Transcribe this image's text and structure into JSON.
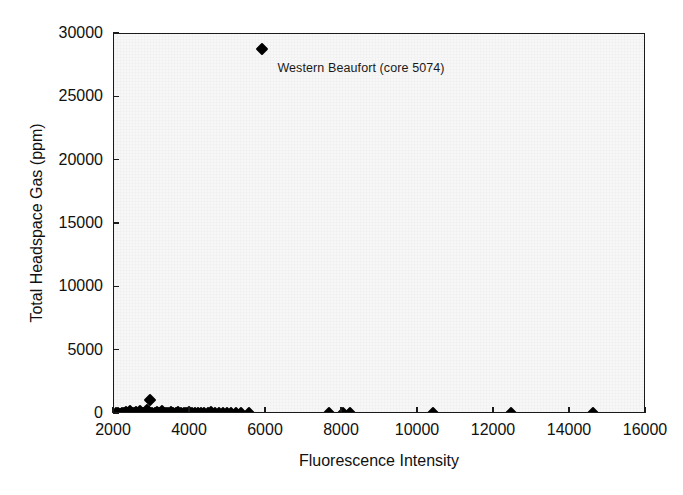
{
  "chart_data": {
    "type": "scatter",
    "title": "",
    "xlabel": "Fluorescence Intensity",
    "ylabel": "Total Headspace Gas (ppm)",
    "xlim": [
      2000,
      16000
    ],
    "ylim": [
      0,
      30000
    ],
    "xticks": [
      2000,
      4000,
      6000,
      8000,
      10000,
      12000,
      14000,
      16000
    ],
    "yticks": [
      0,
      5000,
      10000,
      15000,
      20000,
      25000,
      30000
    ],
    "xtick_labels": [
      "2000",
      "4000",
      "6000",
      "8000",
      "10000",
      "12000",
      "14000",
      "16000"
    ],
    "ytick_labels": [
      "0",
      "5000",
      "10000",
      "15000",
      "20000",
      "25000",
      "30000"
    ],
    "grid": false,
    "legend": false,
    "marker_style": "filled-diamond",
    "marker_color": "#000000",
    "plot_background_color": "#f7f7f7",
    "axis_color": "#1a1a1a",
    "series": [
      {
        "name": "samples",
        "points": [
          [
            2060,
            40
          ],
          [
            2110,
            60
          ],
          [
            2160,
            30
          ],
          [
            2210,
            80
          ],
          [
            2260,
            50
          ],
          [
            2310,
            120
          ],
          [
            2360,
            60
          ],
          [
            2420,
            200
          ],
          [
            2470,
            90
          ],
          [
            2520,
            40
          ],
          [
            2580,
            150
          ],
          [
            2630,
            70
          ],
          [
            2690,
            260
          ],
          [
            2740,
            110
          ],
          [
            2800,
            60
          ],
          [
            2860,
            340
          ],
          [
            2910,
            180
          ],
          [
            2960,
            1100
          ],
          [
            3010,
            90
          ],
          [
            3070,
            50
          ],
          [
            3130,
            130
          ],
          [
            3190,
            70
          ],
          [
            3250,
            210
          ],
          [
            3310,
            60
          ],
          [
            3370,
            100
          ],
          [
            3430,
            40
          ],
          [
            3490,
            160
          ],
          [
            3560,
            70
          ],
          [
            3620,
            50
          ],
          [
            3690,
            120
          ],
          [
            3760,
            60
          ],
          [
            3830,
            90
          ],
          [
            3900,
            40
          ],
          [
            3980,
            140
          ],
          [
            4050,
            70
          ],
          [
            4130,
            50
          ],
          [
            4210,
            100
          ],
          [
            4290,
            60
          ],
          [
            4380,
            80
          ],
          [
            4470,
            40
          ],
          [
            4560,
            130
          ],
          [
            4660,
            60
          ],
          [
            4760,
            90
          ],
          [
            4870,
            50
          ],
          [
            4980,
            70
          ],
          [
            5090,
            40
          ],
          [
            5210,
            100
          ],
          [
            5340,
            60
          ],
          [
            5560,
            50
          ],
          [
            7650,
            40
          ],
          [
            8030,
            60
          ],
          [
            8210,
            40
          ],
          [
            10400,
            50
          ],
          [
            12450,
            40
          ],
          [
            14600,
            50
          ],
          [
            5900,
            28800
          ]
        ]
      }
    ],
    "annotations": [
      {
        "text": "Western Beaufort (core 5074)",
        "point_x": 5900,
        "point_y": 28800,
        "label_x": 6300,
        "label_y": 27200
      }
    ]
  }
}
